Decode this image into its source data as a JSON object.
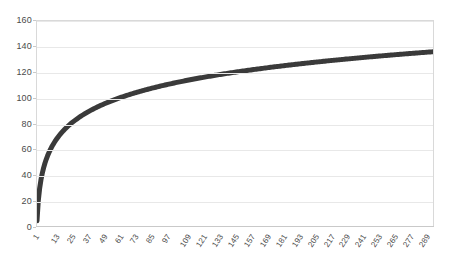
{
  "chart_data": {
    "type": "line",
    "title": "",
    "subtitle": "",
    "xlabel": "",
    "ylabel": "",
    "grid": true,
    "legend": false,
    "legend_position": "none",
    "xlim": [
      1,
      300
    ],
    "ylim": [
      0,
      160
    ],
    "y_ticks": [
      0,
      20,
      40,
      60,
      80,
      100,
      120,
      140,
      160
    ],
    "x_ticks": [
      1,
      13,
      25,
      37,
      49,
      61,
      73,
      85,
      97,
      109,
      121,
      133,
      145,
      157,
      169,
      181,
      193,
      205,
      217,
      229,
      241,
      253,
      265,
      277,
      289
    ],
    "series": [
      {
        "name": "series-1",
        "color": "#3a3a3a",
        "line_width": 5,
        "x": [
          1,
          13,
          25,
          37,
          49,
          61,
          73,
          85,
          97,
          109,
          121,
          133,
          145,
          157,
          169,
          181,
          193,
          205,
          217,
          229,
          241,
          253,
          265,
          277,
          289,
          300
        ],
        "values": [
          4,
          37,
          51,
          60,
          66,
          71,
          75,
          79,
          82,
          85,
          87,
          89,
          91,
          93,
          95,
          97,
          98,
          100,
          101,
          103,
          104,
          105,
          106,
          108,
          109,
          136
        ]
      }
    ],
    "curve_model": {
      "description": "logarithmic growth curve rising from about 4 at x=1 to about 136 at x=300",
      "start_value": 4,
      "end_value": 136
    }
  },
  "axes": {
    "y_tick_labels": [
      "160",
      "140",
      "120",
      "100",
      "80",
      "60",
      "40",
      "20",
      "0"
    ],
    "x_tick_labels": [
      "1",
      "13",
      "25",
      "37",
      "49",
      "61",
      "73",
      "85",
      "97",
      "109",
      "121",
      "133",
      "145",
      "157",
      "169",
      "181",
      "193",
      "205",
      "217",
      "229",
      "241",
      "253",
      "265",
      "277",
      "289"
    ]
  },
  "colors": {
    "series": "#3a3a3a",
    "gridline": "#e8e8e8",
    "border": "#d9d9d9",
    "text": "#4a4a4a",
    "background": "#ffffff"
  }
}
